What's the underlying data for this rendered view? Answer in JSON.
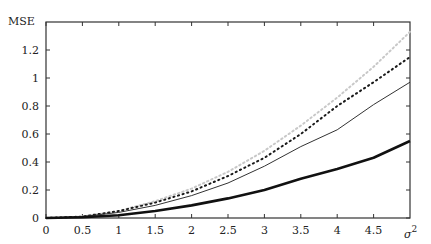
{
  "chart_data": {
    "type": "line",
    "title": "",
    "xlabel": "σ²",
    "ylabel": "MSE",
    "xlim": [
      0,
      5
    ],
    "ylim": [
      0,
      1.35
    ],
    "grid": false,
    "legend": "none",
    "x_ticks": [
      "0",
      "0.5",
      "1",
      "1.5",
      "2",
      "2.5",
      "3",
      "3.5",
      "4",
      "4.5"
    ],
    "y_ticks": [
      "0",
      "0.2",
      "0.4",
      "0.6",
      "0.8",
      "1",
      "1.2"
    ],
    "x": [
      0,
      0.5,
      1,
      1.5,
      2,
      2.5,
      3,
      3.5,
      4,
      4.5,
      5
    ],
    "series": [
      {
        "name": "light-dotted",
        "style": "dotted-light",
        "values": [
          0,
          0.01,
          0.05,
          0.12,
          0.21,
          0.33,
          0.48,
          0.66,
          0.86,
          1.08,
          1.33
        ]
      },
      {
        "name": "dark-dotted",
        "style": "dotted-dark",
        "values": [
          0,
          0.01,
          0.05,
          0.11,
          0.19,
          0.3,
          0.43,
          0.6,
          0.8,
          0.97,
          1.15
        ]
      },
      {
        "name": "thin-solid",
        "style": "solid-thin",
        "values": [
          0,
          0.01,
          0.04,
          0.09,
          0.16,
          0.25,
          0.37,
          0.51,
          0.63,
          0.81,
          0.97
        ]
      },
      {
        "name": "thick-solid",
        "style": "solid-thick",
        "values": [
          0,
          0.005,
          0.02,
          0.05,
          0.09,
          0.14,
          0.2,
          0.28,
          0.35,
          0.43,
          0.55
        ]
      }
    ]
  }
}
